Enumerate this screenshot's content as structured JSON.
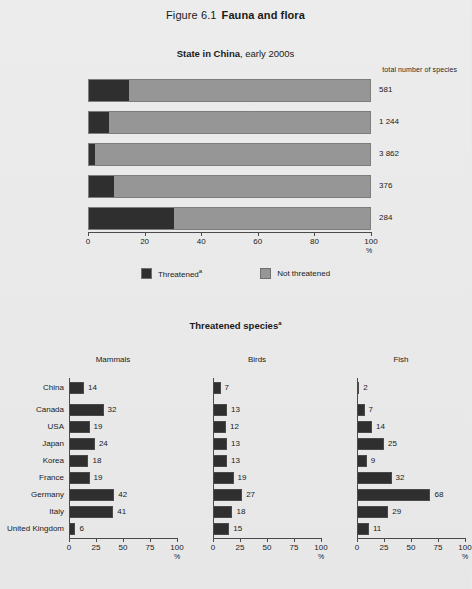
{
  "figure": {
    "number": "Figure 6.1",
    "name": "Fauna and flora"
  },
  "upper_chart": {
    "title_bold": "State in China",
    "title_rest": ", early 2000s",
    "total_header": "total number of species",
    "axis_unit": "%",
    "legend": [
      {
        "label": "Threatened",
        "footnote": "a",
        "color": "#2f2f2f",
        "name": "threatened"
      },
      {
        "label": "Not threatened",
        "footnote": "",
        "color": "#969696",
        "name": "not-threatened"
      }
    ]
  },
  "lower_chart": {
    "title": "Threatened species",
    "title_footnote": "a",
    "axis_unit": "%"
  },
  "chart_data": [
    {
      "type": "bar",
      "orientation": "horizontal",
      "stacked": true,
      "title": "State in China, early 2000s",
      "xlabel": "%",
      "ylabel": "",
      "xlim": [
        0,
        100
      ],
      "xticks": [
        0,
        20,
        40,
        60,
        80,
        100
      ],
      "grid": false,
      "categories": [
        "Mammals",
        "Birds",
        "Fish",
        "Reptiles",
        "Amphibians"
      ],
      "series": [
        {
          "name": "Threatened",
          "color": "#2f2f2f",
          "values": [
            14,
            7,
            2,
            9,
            30
          ]
        },
        {
          "name": "Not threatened",
          "color": "#969696",
          "values": [
            86,
            93,
            98,
            91,
            70
          ]
        }
      ],
      "annotations": {
        "header": "total number of species",
        "totals": [
          "581",
          "1 244",
          "3 862",
          "376",
          "284"
        ]
      }
    },
    {
      "type": "bar",
      "orientation": "horizontal",
      "title": "Threatened species",
      "panel": "Mammals",
      "xlabel": "%",
      "xlim": [
        0,
        100
      ],
      "xticks": [
        0,
        25,
        50,
        75,
        100
      ],
      "grid": false,
      "categories": [
        "China",
        "Canada",
        "USA",
        "Japan",
        "Korea",
        "France",
        "Germany",
        "Italy",
        "United Kingdom"
      ],
      "values": [
        14,
        32,
        19,
        24,
        18,
        19,
        42,
        41,
        6
      ],
      "color": "#2f2f2f"
    },
    {
      "type": "bar",
      "orientation": "horizontal",
      "title": "Threatened species",
      "panel": "Birds",
      "xlabel": "%",
      "xlim": [
        0,
        100
      ],
      "xticks": [
        0,
        25,
        50,
        75,
        100
      ],
      "grid": false,
      "categories": [
        "China",
        "Canada",
        "USA",
        "Japan",
        "Korea",
        "France",
        "Germany",
        "Italy",
        "United Kingdom"
      ],
      "values": [
        7,
        13,
        12,
        13,
        13,
        19,
        27,
        18,
        15
      ],
      "color": "#2f2f2f"
    },
    {
      "type": "bar",
      "orientation": "horizontal",
      "title": "Threatened species",
      "panel": "Fish",
      "xlabel": "%",
      "xlim": [
        0,
        100
      ],
      "xticks": [
        0,
        25,
        50,
        75,
        100
      ],
      "grid": false,
      "categories": [
        "China",
        "Canada",
        "USA",
        "Japan",
        "Korea",
        "France",
        "Germany",
        "Italy",
        "United Kingdom"
      ],
      "values": [
        2,
        7,
        14,
        25,
        9,
        32,
        68,
        29,
        11
      ],
      "color": "#2f2f2f"
    }
  ]
}
